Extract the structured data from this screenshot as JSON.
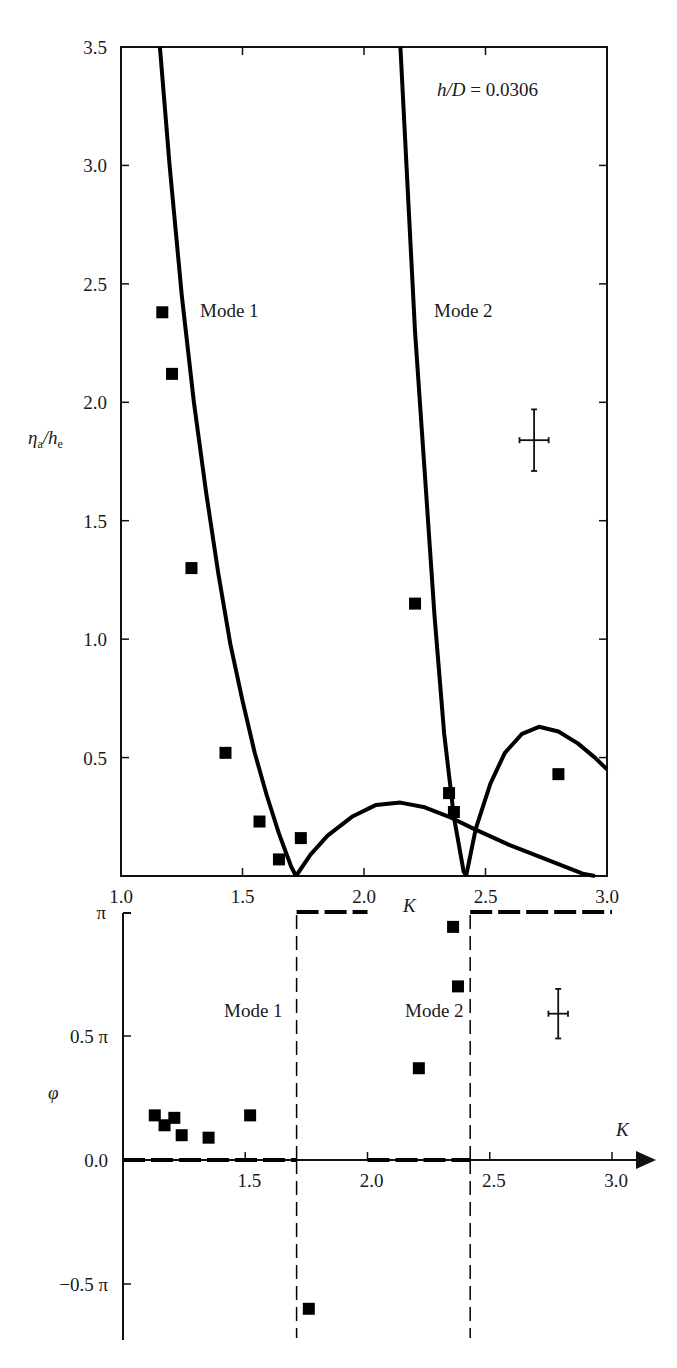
{
  "chart_data": [
    {
      "type": "line",
      "panel": "top",
      "title": "",
      "annotation": "h/D = 0.0306",
      "annotation_parts": {
        "var": "h/D",
        "eq": " = 0.0306"
      },
      "xlabel": "K",
      "ylabel": "ηa/he",
      "ylabel_parts": {
        "main": "η",
        "sub1": "a",
        "slash": "/h",
        "sub2": "e"
      },
      "xlim": [
        1.0,
        3.0
      ],
      "ylim": [
        0.0,
        3.5
      ],
      "xticks": [
        1.0,
        1.5,
        2.0,
        2.5,
        3.0
      ],
      "xtick_labels": [
        "1.0",
        "1.5",
        "2.0",
        "2.5",
        "3.0"
      ],
      "yticks": [
        0.5,
        1.0,
        1.5,
        2.0,
        2.5,
        3.0,
        3.5
      ],
      "ytick_labels": [
        "0.5",
        "1.0",
        "1.5",
        "2.0",
        "2.5",
        "3.0",
        "3.5"
      ],
      "grid": false,
      "mode_labels": [
        {
          "text": "Mode 1",
          "x": 1.32,
          "y": 2.25
        },
        {
          "text": "Mode 2",
          "x": 2.28,
          "y": 2.25
        }
      ],
      "series": [
        {
          "name": "Mode 1 theory (left branch)",
          "style": "solid",
          "points": [
            [
              1.16,
              3.5
            ],
            [
              1.2,
              3.0
            ],
            [
              1.25,
              2.45
            ],
            [
              1.3,
              2.0
            ],
            [
              1.35,
              1.62
            ],
            [
              1.4,
              1.28
            ],
            [
              1.45,
              0.98
            ],
            [
              1.5,
              0.74
            ],
            [
              1.55,
              0.52
            ],
            [
              1.6,
              0.34
            ],
            [
              1.65,
              0.18
            ],
            [
              1.7,
              0.04
            ],
            [
              1.72,
              0.0
            ]
          ]
        },
        {
          "name": "Mode 1 theory (right branch)",
          "style": "solid",
          "points": [
            [
              1.72,
              0.0
            ],
            [
              1.78,
              0.09
            ],
            [
              1.85,
              0.17
            ],
            [
              1.95,
              0.25
            ],
            [
              2.05,
              0.3
            ],
            [
              2.15,
              0.31
            ],
            [
              2.25,
              0.29
            ],
            [
              2.35,
              0.25
            ],
            [
              2.45,
              0.2
            ],
            [
              2.6,
              0.13
            ],
            [
              2.75,
              0.07
            ],
            [
              2.9,
              0.01
            ],
            [
              2.95,
              0.0
            ]
          ]
        },
        {
          "name": "Mode 2 theory (left branch)",
          "style": "solid",
          "points": [
            [
              2.15,
              3.5
            ],
            [
              2.18,
              2.9
            ],
            [
              2.21,
              2.3
            ],
            [
              2.25,
              1.7
            ],
            [
              2.29,
              1.1
            ],
            [
              2.33,
              0.6
            ],
            [
              2.37,
              0.25
            ],
            [
              2.41,
              0.02
            ],
            [
              2.42,
              0.0
            ]
          ]
        },
        {
          "name": "Mode 2 theory (right branch)",
          "style": "solid",
          "points": [
            [
              2.42,
              0.0
            ],
            [
              2.46,
              0.2
            ],
            [
              2.52,
              0.39
            ],
            [
              2.58,
              0.52
            ],
            [
              2.65,
              0.6
            ],
            [
              2.72,
              0.63
            ],
            [
              2.8,
              0.61
            ],
            [
              2.88,
              0.56
            ],
            [
              2.95,
              0.5
            ],
            [
              3.0,
              0.45
            ]
          ]
        },
        {
          "name": "Experiment",
          "style": "square-marker",
          "points": [
            [
              1.17,
              2.38
            ],
            [
              1.21,
              2.12
            ],
            [
              1.29,
              1.3
            ],
            [
              1.43,
              0.52
            ],
            [
              1.57,
              0.23
            ],
            [
              1.65,
              0.07
            ],
            [
              1.74,
              0.16
            ],
            [
              2.21,
              1.15
            ],
            [
              2.35,
              0.35
            ],
            [
              2.37,
              0.27
            ],
            [
              2.8,
              0.43
            ]
          ]
        }
      ],
      "error_bar": {
        "x": 2.7,
        "y": 1.84,
        "xerr": 0.06,
        "yerr": 0.13
      }
    },
    {
      "type": "line",
      "panel": "bottom",
      "title": "",
      "xlabel": "K",
      "ylabel": "φ",
      "xlim": [
        1.0,
        3.0
      ],
      "ylim": [
        -0.6,
        1.0
      ],
      "y_unit": "π",
      "xticks": [
        1.5,
        2.0,
        2.5,
        3.0
      ],
      "xtick_labels": [
        "1.5",
        "2.0",
        "2.5",
        "3.0"
      ],
      "yticks": [
        -0.5,
        0.0,
        0.5,
        1.0
      ],
      "ytick_labels": [
        "−0.5 π",
        "0.0",
        "0.5 π",
        "π"
      ],
      "grid": false,
      "mode_labels": [
        {
          "text": "Mode 1",
          "x": 1.6,
          "y": 0.52
        },
        {
          "text": "Mode 2",
          "x": 2.32,
          "y": 0.52
        }
      ],
      "series": [
        {
          "name": "Theory phase",
          "style": "dashed",
          "points": [
            [
              1.0,
              0.0
            ],
            [
              1.71,
              0.0
            ],
            [
              1.71,
              1.0
            ],
            [
              2.0,
              1.0
            ]
          ]
        },
        {
          "name": "Theory phase (mode 2)",
          "style": "dashed",
          "points": [
            [
              2.0,
              0.0
            ],
            [
              2.42,
              0.0
            ],
            [
              2.42,
              1.0
            ],
            [
              3.0,
              1.0
            ]
          ]
        },
        {
          "name": "Experiment",
          "style": "square-marker",
          "points": [
            [
              1.13,
              0.18
            ],
            [
              1.17,
              0.14
            ],
            [
              1.21,
              0.17
            ],
            [
              1.24,
              0.1
            ],
            [
              1.35,
              0.09
            ],
            [
              1.52,
              0.18
            ],
            [
              1.76,
              -0.6
            ],
            [
              2.21,
              0.37
            ],
            [
              2.35,
              0.94
            ],
            [
              2.37,
              0.7
            ]
          ]
        }
      ],
      "error_bar": {
        "x": 2.78,
        "y": 0.59,
        "xerr": 0.04,
        "yerr": 0.1
      }
    }
  ]
}
